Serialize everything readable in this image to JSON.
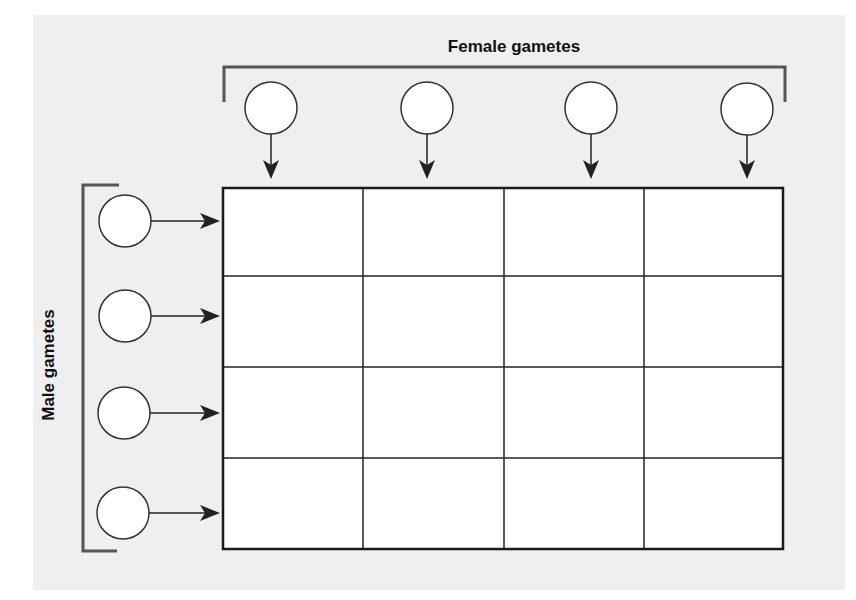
{
  "diagram": {
    "type": "punnett-square",
    "top_label": "Female gametes",
    "left_label": "Male gametes",
    "rows": 4,
    "columns": 4,
    "female_gametes": [
      "",
      "",
      "",
      ""
    ],
    "male_gametes": [
      "",
      "",
      "",
      ""
    ],
    "cells": [
      [
        "",
        "",
        "",
        ""
      ],
      [
        "",
        "",
        "",
        ""
      ],
      [
        "",
        "",
        "",
        ""
      ],
      [
        "",
        "",
        "",
        ""
      ]
    ],
    "colors": {
      "background_panel": "#efefef",
      "grid_fill": "#ffffff",
      "stroke": "#222222",
      "bracket": "#555555"
    }
  }
}
